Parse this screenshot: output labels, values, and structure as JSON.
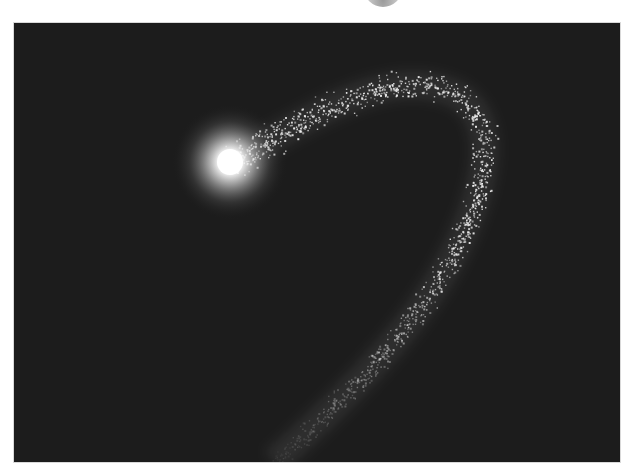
{
  "scene": {
    "description": "Comet with bright glowing head and curved sparkling particle tail on dark background",
    "background_color": "#1c1c1c",
    "page_color": "#ffffff",
    "head": {
      "cx": 216,
      "cy": 139,
      "core_color": "#ffffff",
      "glow_color": "#cfcfcf"
    },
    "tail_color": "#f2f2f2",
    "tail_path": "M 216 139 C 290 100, 370 40, 440 70 C 490 95, 470 170, 440 230 C 410 290, 350 360, 260 439"
  }
}
